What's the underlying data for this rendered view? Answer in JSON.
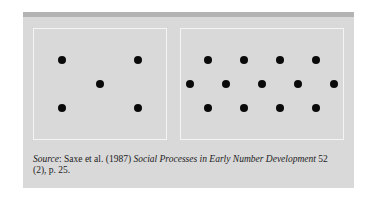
{
  "figure": {
    "left_box": {
      "dot_count": 5,
      "dots": [
        [
          62,
          60
        ],
        [
          138,
          60
        ],
        [
          100,
          84
        ],
        [
          62,
          108
        ],
        [
          138,
          108
        ]
      ]
    },
    "right_box": {
      "dot_count": 13,
      "dots": [
        [
          208,
          60
        ],
        [
          244,
          60
        ],
        [
          280,
          60
        ],
        [
          316,
          60
        ],
        [
          190,
          84
        ],
        [
          226,
          84
        ],
        [
          262,
          84
        ],
        [
          298,
          84
        ],
        [
          334,
          84
        ],
        [
          208,
          108
        ],
        [
          244,
          108
        ],
        [
          280,
          108
        ],
        [
          316,
          108
        ]
      ]
    }
  },
  "caption": {
    "label": "Source",
    "authors": ": Saxe et al. (1987) ",
    "title": "Social Processes in Early Number Development",
    "rest": " 52 (2), p. 25."
  }
}
